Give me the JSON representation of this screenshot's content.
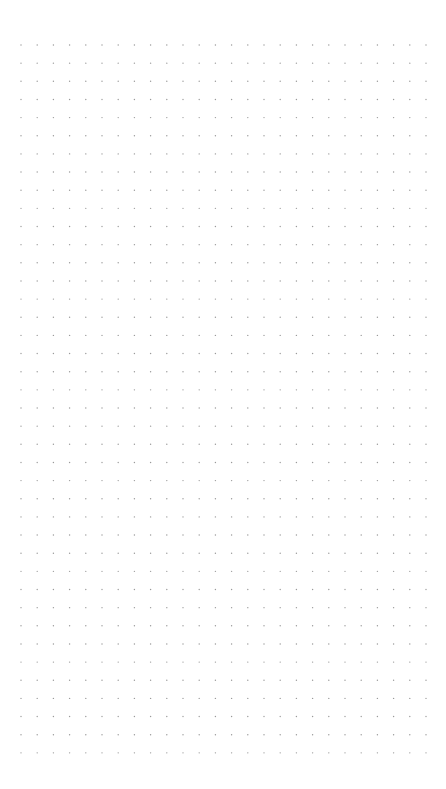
{
  "page": {
    "type": "dot-grid",
    "background_color": "#ffffff",
    "dot_color": "#9a9a9a"
  },
  "grid": {
    "columns": 26,
    "rows": 40,
    "origin_x": 21,
    "origin_y": 45,
    "spacing_x": 16.2,
    "spacing_y": 18.15,
    "dot_radius": 0.7
  }
}
